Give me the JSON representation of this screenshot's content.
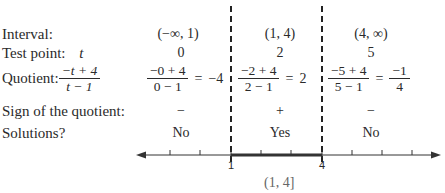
{
  "row_labels": {
    "interval": "Interval:",
    "test_point": "Test point:",
    "test_point_var": "t",
    "quotient": "Quotient:",
    "quotient_num": "−t + 4",
    "quotient_den": "t − 1",
    "sign": "Sign of the quotient:",
    "solutions": "Solutions?"
  },
  "columns": [
    {
      "interval": "(−∞, 1)",
      "test_point": "0",
      "num": "−0 + 4",
      "den": "0 − 1",
      "eq": "=",
      "result": "−4",
      "result_is_frac": false,
      "sign": "−",
      "solution": "No"
    },
    {
      "interval": "(1, 4)",
      "test_point": "2",
      "num": "−2 + 4",
      "den": "2 − 1",
      "eq": "=",
      "result": "2",
      "result_is_frac": false,
      "sign": "+",
      "solution": "Yes"
    },
    {
      "interval": "(4, ∞)",
      "test_point": "5",
      "num": "−5 + 4",
      "den": "5 − 1",
      "eq": "=",
      "result_num": "−1",
      "result_den": "4",
      "result_is_frac": true,
      "sign": "−",
      "solution": "No"
    }
  ],
  "number_line": {
    "tick_labels": [
      "1",
      "4"
    ],
    "solution_interval": "(1, 4]"
  }
}
